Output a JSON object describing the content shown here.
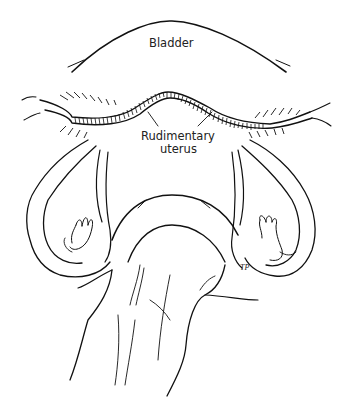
{
  "figure": {
    "type": "anatomical line illustration",
    "labels": {
      "bladder": "Bladder",
      "uterus_line1": "Rudimentary",
      "uterus_line2": "uterus"
    },
    "signature": "TP",
    "colors": {
      "ink": "#111111",
      "background": "#ffffff"
    }
  }
}
